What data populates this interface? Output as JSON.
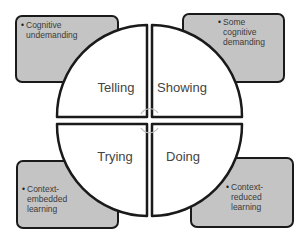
{
  "diagram": {
    "type": "quadrant-circle",
    "quadrants": [
      {
        "id": "top-left",
        "label": "Telling"
      },
      {
        "id": "top-right",
        "label": "Showing"
      },
      {
        "id": "bottom-left",
        "label": "Trying"
      },
      {
        "id": "bottom-right",
        "label": "Doing"
      }
    ],
    "corner_boxes": [
      {
        "id": "top-left",
        "bullet": "•",
        "lines": [
          "Cognitive",
          "undemanding"
        ]
      },
      {
        "id": "top-right",
        "bullet": "•",
        "lines": [
          "Some",
          "cognitive",
          "demanding"
        ]
      },
      {
        "id": "bottom-left",
        "bullet": "•",
        "lines": [
          "Context-",
          "embedded",
          "learning"
        ]
      },
      {
        "id": "bottom-right",
        "bullet": "•",
        "lines": [
          "Context-",
          "reduced",
          "learning"
        ]
      }
    ],
    "colors": {
      "box_fill": "#c4c4c4",
      "outline": "#1a1a1a",
      "circle_fill": "#ffffff",
      "label_text": "#444444",
      "center_arrows": "#bdbdbd"
    }
  }
}
